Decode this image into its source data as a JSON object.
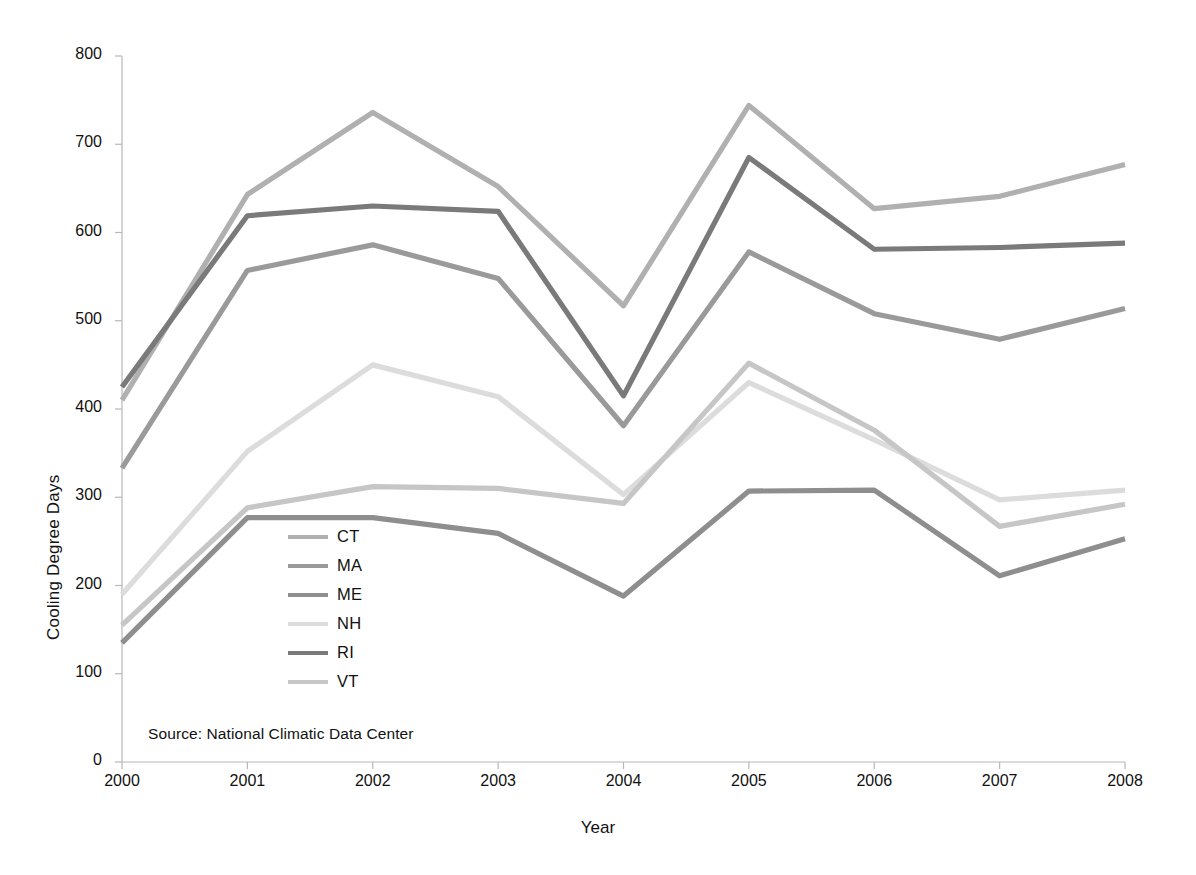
{
  "chart_data": {
    "type": "line",
    "title": "",
    "xlabel": "Year",
    "ylabel": "Cooling Degree Days",
    "categories": [
      2000,
      2001,
      2002,
      2003,
      2004,
      2005,
      2006,
      2007,
      2008
    ],
    "x_tick_labels": [
      "2000",
      "2001",
      "2002",
      "2003",
      "2004",
      "2005",
      "2006",
      "2007",
      "2008"
    ],
    "y_tick_labels": [
      "0",
      "100",
      "200",
      "300",
      "400",
      "500",
      "600",
      "700",
      "800"
    ],
    "ylim": [
      0,
      800
    ],
    "y_tick_step": 100,
    "xlim": [
      2000,
      2008
    ],
    "grid": false,
    "legend_position": "inside-left-lower",
    "annotation": "Source: National Climatic Data Center",
    "series": [
      {
        "name": "CT",
        "color": "#b0b0b0",
        "values": [
          410,
          643,
          736,
          652,
          517,
          744,
          627,
          641,
          677
        ]
      },
      {
        "name": "MA",
        "color": "#9a9a9a",
        "values": [
          333,
          557,
          586,
          548,
          381,
          578,
          508,
          479,
          514
        ]
      },
      {
        "name": "ME",
        "color": "#8e8e8e",
        "values": [
          135,
          277,
          277,
          259,
          188,
          307,
          308,
          211,
          253
        ]
      },
      {
        "name": "NH",
        "color": "#dcdcdc",
        "values": [
          190,
          352,
          450,
          414,
          303,
          430,
          365,
          297,
          308
        ]
      },
      {
        "name": "RI",
        "color": "#7a7a7a",
        "values": [
          425,
          619,
          630,
          624,
          415,
          685,
          581,
          583,
          588
        ]
      },
      {
        "name": "VT",
        "color": "#c6c6c6",
        "values": [
          155,
          288,
          312,
          310,
          293,
          452,
          376,
          267,
          292
        ]
      }
    ]
  },
  "legend": {
    "items": [
      {
        "label": "CT",
        "color": "#b0b0b0"
      },
      {
        "label": "MA",
        "color": "#9a9a9a"
      },
      {
        "label": "ME",
        "color": "#8e8e8e"
      },
      {
        "label": "NH",
        "color": "#dcdcdc"
      },
      {
        "label": "RI",
        "color": "#7a7a7a"
      },
      {
        "label": "VT",
        "color": "#c6c6c6"
      }
    ]
  },
  "axes": {
    "y_title": "Cooling Degree Days",
    "x_title": "Year"
  },
  "source": {
    "text": "Source: National Climatic Data Center"
  },
  "style": {
    "axis_color": "#b8b8b8",
    "text_color": "#111111",
    "background": "#ffffff"
  }
}
